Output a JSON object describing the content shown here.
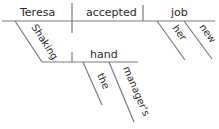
{
  "diagram": {
    "type": "sentence-diagram",
    "words": {
      "subject": "Teresa",
      "verb": "accepted",
      "object": "job",
      "object_modifier_1": "her",
      "object_modifier_2": "new",
      "participle": "Shaking",
      "participle_object": "hand",
      "participle_object_modifier_1": "the",
      "participle_object_modifier_2": "manager's"
    },
    "colors": {
      "line": "#7a7a7a",
      "text": "#2a2a2a",
      "background": "#ffffff"
    }
  }
}
